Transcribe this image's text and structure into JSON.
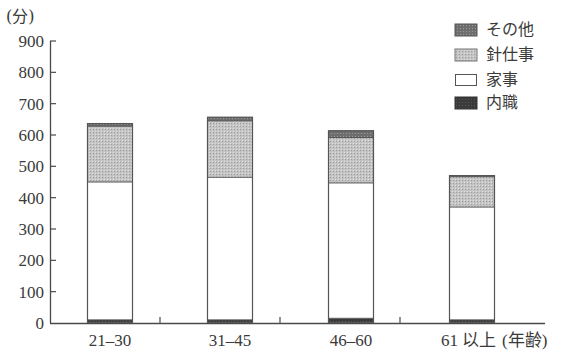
{
  "chart_data": {
    "type": "bar",
    "stacked": true,
    "title": "",
    "xlabel": "(年齢)",
    "ylabel": "(分)",
    "ylim": [
      0,
      900
    ],
    "yticks": [
      0,
      100,
      200,
      300,
      400,
      500,
      600,
      700,
      800,
      900
    ],
    "categories": [
      "21–30",
      "31–45",
      "46–60",
      "61 以上"
    ],
    "series": [
      {
        "name": "内職",
        "values": [
          10,
          10,
          15,
          10
        ],
        "color": "#3a3a3a",
        "pattern": "dark-dots"
      },
      {
        "name": "家事",
        "values": [
          440,
          455,
          432,
          360
        ],
        "color": "#ffffff",
        "pattern": "none"
      },
      {
        "name": "針仕事",
        "values": [
          178,
          180,
          145,
          97
        ],
        "color": "#bcbcbc",
        "pattern": "light-dots"
      },
      {
        "name": "その他",
        "values": [
          10,
          13,
          23,
          5
        ],
        "color": "#6e6e6e",
        "pattern": "mid-dots"
      }
    ],
    "totals": [
      638,
      658,
      615,
      472
    ],
    "legend": {
      "position": "top-right",
      "order": [
        "その他",
        "針仕事",
        "家事",
        "内職"
      ]
    },
    "grid": false
  },
  "axis": {
    "unit_label": "(分)",
    "x_suffix": "(年齢)"
  },
  "legend_items": [
    {
      "label": "その他",
      "color": "#6e6e6e"
    },
    {
      "label": "針仕事",
      "color": "#bcbcbc"
    },
    {
      "label": "家事",
      "color": "#ffffff"
    },
    {
      "label": "内職",
      "color": "#3a3a3a"
    }
  ]
}
